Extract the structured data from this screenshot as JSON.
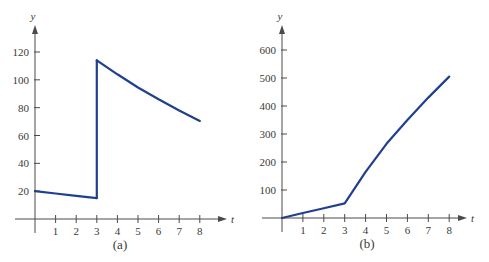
{
  "colors": {
    "curve": "#1f3f8f",
    "axis": "#4a4a4a",
    "text": "#3a3a3a",
    "background": "#ffffff"
  },
  "chart_data": [
    {
      "type": "line",
      "title": "",
      "caption": "(a)",
      "xlabel": "t",
      "ylabel": "y",
      "xlim": [
        0,
        8.5
      ],
      "ylim": [
        0,
        130
      ],
      "x_ticks": [
        1,
        2,
        3,
        4,
        5,
        6,
        7,
        8
      ],
      "y_ticks": [
        20,
        40,
        60,
        80,
        100,
        120
      ],
      "grid": false,
      "legend": null,
      "annotations": [
        "jump discontinuity at t=3"
      ],
      "series": [
        {
          "name": "segment-before-jump",
          "x": [
            0,
            1,
            2,
            3
          ],
          "y": [
            20,
            18.3,
            16.6,
            15
          ]
        },
        {
          "name": "vertical-jump",
          "x": [
            3,
            3
          ],
          "y": [
            15,
            114
          ]
        },
        {
          "name": "segment-after-jump",
          "x": [
            3,
            4,
            5,
            6,
            7,
            8
          ],
          "y": [
            114,
            104,
            94.5,
            86,
            78,
            70.5
          ]
        }
      ]
    },
    {
      "type": "line",
      "title": "",
      "caption": "(b)",
      "xlabel": "t",
      "ylabel": "y",
      "xlim": [
        0,
        8.5
      ],
      "ylim": [
        0,
        650
      ],
      "x_ticks": [
        1,
        2,
        3,
        4,
        5,
        6,
        7,
        8
      ],
      "y_ticks": [
        100,
        200,
        300,
        400,
        500,
        600
      ],
      "grid": false,
      "legend": null,
      "series": [
        {
          "name": "y(t)",
          "x": [
            0,
            1,
            2,
            3,
            4,
            5,
            6,
            7,
            8
          ],
          "y": [
            0,
            18,
            35,
            52,
            165,
            265,
            350,
            430,
            505
          ]
        }
      ]
    }
  ]
}
